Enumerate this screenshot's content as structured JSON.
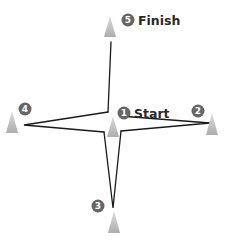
{
  "diagram": {
    "title": "",
    "colors": {
      "badge": "#666666",
      "cone_top": "#d6d6d6",
      "cone_bottom": "#b2b2b2",
      "path": "#1a1a1a"
    },
    "cones": [
      {
        "id": 1,
        "badge": "1",
        "label": "Start"
      },
      {
        "id": 2,
        "badge": "2",
        "label": ""
      },
      {
        "id": 3,
        "badge": "3",
        "label": ""
      },
      {
        "id": 4,
        "badge": "4",
        "label": ""
      },
      {
        "id": 5,
        "badge": "5",
        "label": "Finish"
      }
    ]
  }
}
